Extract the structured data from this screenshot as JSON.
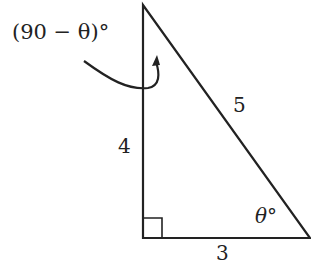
{
  "diagram": {
    "type": "right-triangle",
    "angle_label_top": "(90 − θ)°",
    "angle_label_bottom": "θ°",
    "side_vertical": "4",
    "side_horizontal": "3",
    "side_hypotenuse": "5",
    "stroke_color": "#222222"
  }
}
